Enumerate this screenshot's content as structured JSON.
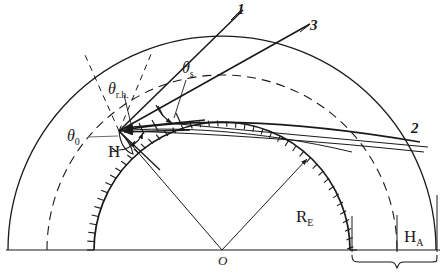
{
  "figure": {
    "background_color": "#ffffff",
    "ink_color": "#1a1a1a",
    "width": 445,
    "height": 273
  },
  "labels": {
    "ray_1": "1",
    "ray_2": "2",
    "ray_3": "3",
    "origin": "O",
    "observer_point": "H",
    "theta_symbol": "θ",
    "theta_rh_sub": "r.h.",
    "theta_s_sub": "s",
    "theta_0_sub": "0",
    "earth_radius_main": "R",
    "earth_radius_sub": "E",
    "atmosphere_height_main": "H",
    "atmosphere_height_sub": "A"
  },
  "geometry": {
    "origin_x": 222,
    "origin_y": 250,
    "baseline_y": 250,
    "earth_radius_px": 128,
    "atmosphere_radius_px": 214,
    "dashed_layer_radius_px": 175,
    "point_H_x": 119,
    "point_H_y": 131
  },
  "annotations": {
    "theta_rh_desc": "refraction half angle at observer",
    "theta_s_desc": "solar zenith-type angle",
    "theta_0_desc": "reference horizontal angle at H",
    "R_E_desc": "Earth radius",
    "H_A_desc": "atmosphere thickness"
  }
}
